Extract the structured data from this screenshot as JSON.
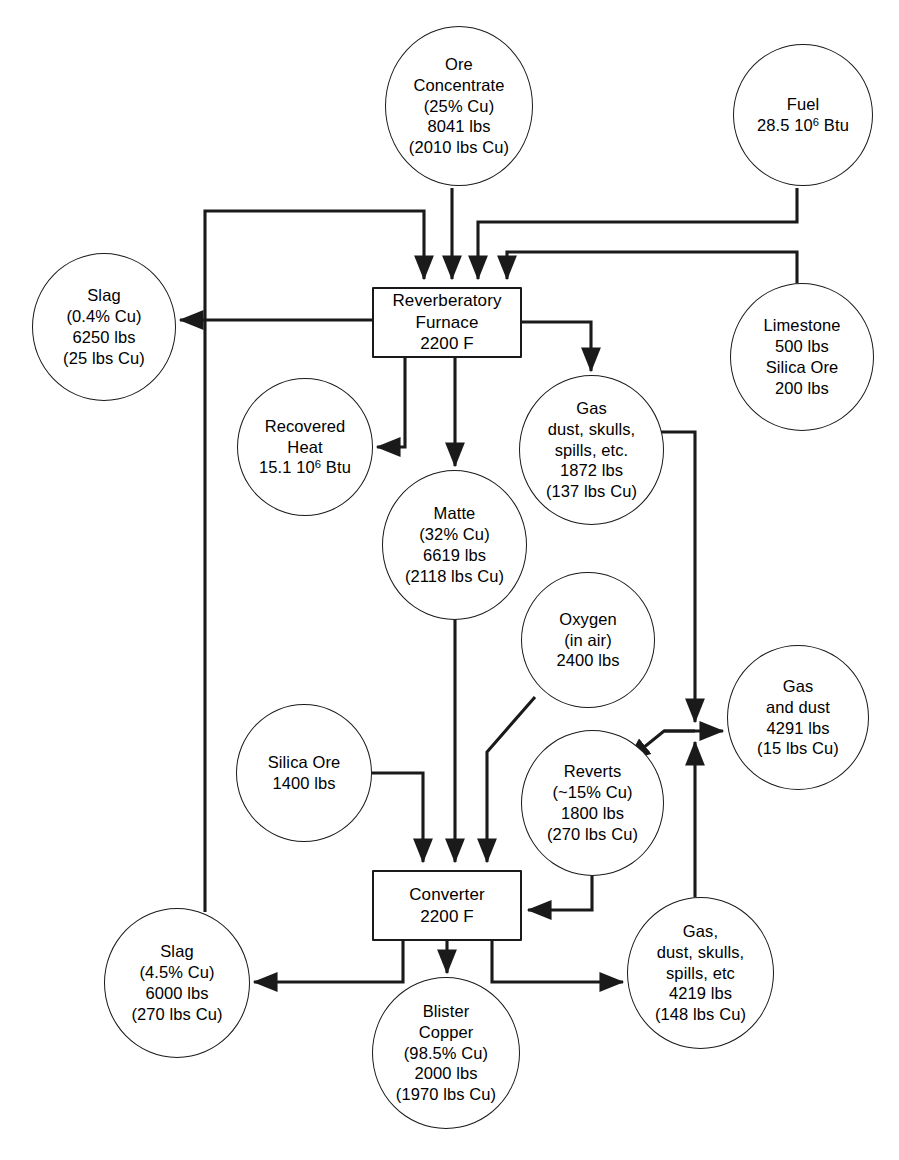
{
  "diagram": {
    "stroke_color": "#1a1a1a",
    "background_color": "#ffffff"
  },
  "nodes": [
    {
      "id": "ore-concentrate",
      "name": "ore-concentrate-node",
      "shape": "circle",
      "lines": [
        "Ore",
        "Concentrate",
        "(25% Cu)",
        "8041 lbs",
        "(2010 lbs Cu)"
      ],
      "x": 385,
      "y": 26,
      "w": 148,
      "h": 160
    },
    {
      "id": "fuel",
      "name": "fuel-node",
      "shape": "circle",
      "lines": [
        "Fuel",
        "28.5 10^6 Btu"
      ],
      "x": 733,
      "y": 44,
      "w": 140,
      "h": 142
    },
    {
      "id": "slag-furnace",
      "name": "furnace-slag-node",
      "shape": "circle",
      "lines": [
        "Slag",
        "(0.4% Cu)",
        "6250 lbs",
        "(25 lbs Cu)"
      ],
      "x": 32,
      "y": 253,
      "w": 144,
      "h": 148
    },
    {
      "id": "reverberatory-furnace",
      "name": "reverberatory-furnace-box",
      "shape": "box",
      "lines": [
        "Reverberatory",
        "Furnace",
        "2200 F"
      ],
      "x": 372,
      "y": 287,
      "w": 150,
      "h": 71
    },
    {
      "id": "limestone",
      "name": "limestone-silica-ore-node",
      "shape": "circle",
      "lines": [
        "Limestone",
        "500 lbs",
        "Silica Ore",
        "200 lbs"
      ],
      "x": 730,
      "y": 283,
      "w": 144,
      "h": 148
    },
    {
      "id": "recovered-heat",
      "name": "recovered-heat-node",
      "shape": "circle",
      "lines": [
        "Recovered",
        "Heat",
        "15.1 10^6 Btu"
      ],
      "x": 237,
      "y": 378,
      "w": 136,
      "h": 138
    },
    {
      "id": "furnace-gas",
      "name": "furnace-gas-dust-node",
      "shape": "circle",
      "lines": [
        "Gas",
        "dust, skulls,",
        "spills, etc.",
        "1872 lbs",
        "(137 lbs Cu)"
      ],
      "x": 519,
      "y": 375,
      "w": 145,
      "h": 150
    },
    {
      "id": "matte",
      "name": "matte-node",
      "shape": "circle",
      "lines": [
        "Matte",
        "(32% Cu)",
        "6619 lbs",
        "(2118 lbs Cu)"
      ],
      "x": 382,
      "y": 470,
      "w": 145,
      "h": 150
    },
    {
      "id": "oxygen",
      "name": "oxygen-node",
      "shape": "circle",
      "lines": [
        "Oxygen",
        "(in air)",
        "2400 lbs"
      ],
      "x": 521,
      "y": 572,
      "w": 134,
      "h": 136
    },
    {
      "id": "converter-gas-dust",
      "name": "converter-gas-and-dust-node",
      "shape": "circle",
      "lines": [
        "Gas",
        "and dust",
        "4291 lbs",
        "(15 lbs Cu)"
      ],
      "x": 727,
      "y": 645,
      "w": 142,
      "h": 145
    },
    {
      "id": "silica-ore",
      "name": "silica-ore-node",
      "shape": "circle",
      "lines": [
        "Silica Ore",
        "1400 lbs"
      ],
      "x": 236,
      "y": 704,
      "w": 136,
      "h": 138
    },
    {
      "id": "reverts",
      "name": "reverts-node",
      "shape": "circle",
      "lines": [
        "Reverts",
        "(~15% Cu)",
        "1800 lbs",
        "(270 lbs Cu)"
      ],
      "x": 521,
      "y": 730,
      "w": 143,
      "h": 146
    },
    {
      "id": "converter",
      "name": "converter-box",
      "shape": "box",
      "lines": [
        "Converter",
        "2200 F"
      ],
      "x": 372,
      "y": 870,
      "w": 150,
      "h": 71
    },
    {
      "id": "slag-converter",
      "name": "converter-slag-node",
      "shape": "circle",
      "lines": [
        "Slag",
        "(4.5% Cu)",
        "6000 lbs",
        "(270 lbs Cu)"
      ],
      "x": 104,
      "y": 908,
      "w": 146,
      "h": 150
    },
    {
      "id": "converter-gas",
      "name": "converter-gas-dust-skulls-node",
      "shape": "circle",
      "lines": [
        "Gas,",
        "dust, skulls,",
        "spills, etc",
        "4219 lbs",
        "(148 lbs Cu)"
      ],
      "x": 627,
      "y": 897,
      "w": 147,
      "h": 152
    },
    {
      "id": "blister-copper",
      "name": "blister-copper-node",
      "shape": "circle",
      "lines": [
        "Blister",
        "Copper",
        "(98.5% Cu)",
        "2000 lbs",
        "(1970 lbs Cu)"
      ],
      "x": 372,
      "y": 977,
      "w": 148,
      "h": 152
    }
  ],
  "flows": [
    {
      "name": "flow-ore-concentrate-to-furnace",
      "from": "ore-concentrate",
      "to": "reverberatory-furnace"
    },
    {
      "name": "flow-fuel-to-furnace",
      "from": "fuel",
      "to": "reverberatory-furnace"
    },
    {
      "name": "flow-limestone-to-furnace",
      "from": "limestone",
      "to": "reverberatory-furnace"
    },
    {
      "name": "flow-converter-slag-recycle-to-furnace",
      "from": "slag-converter",
      "to": "reverberatory-furnace"
    },
    {
      "name": "flow-furnace-to-slag",
      "from": "reverberatory-furnace",
      "to": "slag-furnace"
    },
    {
      "name": "flow-furnace-to-matte",
      "from": "reverberatory-furnace",
      "to": "matte"
    },
    {
      "name": "flow-furnace-to-gas",
      "from": "reverberatory-furnace",
      "to": "furnace-gas"
    },
    {
      "name": "flow-furnace-to-recovered-heat",
      "from": "reverberatory-furnace",
      "to": "recovered-heat"
    },
    {
      "name": "flow-furnace-gas-to-junction",
      "from": "furnace-gas",
      "to": "converter-gas-dust"
    },
    {
      "name": "flow-junction-to-reverts",
      "from": "furnace-gas",
      "to": "reverts"
    },
    {
      "name": "flow-matte-to-converter",
      "from": "matte",
      "to": "converter"
    },
    {
      "name": "flow-oxygen-to-converter",
      "from": "oxygen",
      "to": "converter"
    },
    {
      "name": "flow-silica-ore-to-converter",
      "from": "silica-ore",
      "to": "converter"
    },
    {
      "name": "flow-reverts-to-converter",
      "from": "reverts",
      "to": "converter"
    },
    {
      "name": "flow-converter-to-slag",
      "from": "converter",
      "to": "slag-converter"
    },
    {
      "name": "flow-converter-to-blister-copper",
      "from": "converter",
      "to": "blister-copper"
    },
    {
      "name": "flow-converter-to-gas",
      "from": "converter",
      "to": "converter-gas"
    },
    {
      "name": "flow-converter-gas-to-junction",
      "from": "converter-gas",
      "to": "converter-gas-dust"
    }
  ]
}
